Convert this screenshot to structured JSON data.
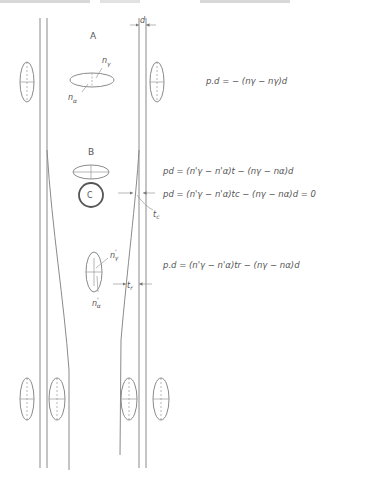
{
  "figure": {
    "top_cutoff_text": "",
    "dimension_label_d": "d",
    "region_labels": {
      "A": "A",
      "B": "B",
      "C": "C"
    },
    "indicatrix_labels": {
      "A_ngamma": "n",
      "A_ngamma_sub": "γ",
      "A_nalpha": "n",
      "A_nalpha_sub": "α",
      "D_ngamma": "n",
      "D_ngamma_sub": "γ",
      "D_ngamma_sup": "'",
      "D_nalpha": "n",
      "D_nalpha_sub": "α",
      "D_nalpha_sup": "'"
    },
    "thickness_labels": {
      "tc": "t",
      "tc_sub": "c",
      "tr": "t",
      "tr_sub": "r"
    },
    "equations": [
      {
        "id": "eq-A",
        "text": "p.d = − (nγ − nγ)d"
      },
      {
        "id": "eq-B",
        "text": "pd = (n'γ − n'α)t − (nγ − nα)d"
      },
      {
        "id": "eq-C",
        "text": "pd = (n'γ − n'α)tc − (nγ − nα)d = 0"
      },
      {
        "id": "eq-D",
        "text": "p.d = (n'γ − n'α)tr − (nγ − nα)d"
      }
    ],
    "colors": {
      "line": "#8a8a8a",
      "text": "#555555",
      "background": "#ffffff"
    }
  }
}
